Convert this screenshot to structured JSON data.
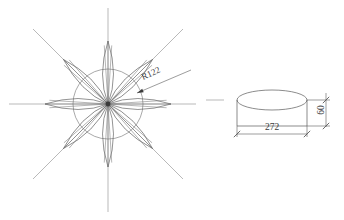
{
  "drawing": {
    "background_color": "#ffffff",
    "line_color": "#5a5a5a",
    "centerline_color": "#8a8a8a",
    "text_color": "#3a3a3a",
    "views": [
      {
        "name": "rosette-plan-view",
        "type": "plan",
        "center": {
          "x": 108,
          "y": 104
        },
        "petal_count": 8,
        "petal_length": 63,
        "petal_half_width": 11,
        "petal_angles_deg": [
          0,
          45,
          90,
          135,
          180,
          225,
          270,
          315
        ],
        "construction_circle_radius": 35,
        "centerlines": [
          {
            "name": "horizontal-centerline",
            "x1": 9,
            "y1": 104,
            "x2": 196,
            "y2": 104
          },
          {
            "name": "vertical-centerline",
            "x1": 108,
            "y1": 8,
            "x2": 108,
            "y2": 212
          },
          {
            "name": "diagonal-centerline-ne",
            "x1": 33,
            "y1": 29,
            "x2": 183,
            "y2": 179
          },
          {
            "name": "diagonal-centerline-nw",
            "x1": 183,
            "y1": 29,
            "x2": 33,
            "y2": 179
          }
        ],
        "radius_dimension": {
          "label": "R122",
          "leader_start": {
            "x": 191,
            "y": 70
          },
          "leader_end": {
            "x": 137,
            "y": 93
          },
          "text_x": 152,
          "text_y": 76,
          "text_rotation_deg": -24
        }
      },
      {
        "name": "cylinder-elevation-view",
        "type": "elevation",
        "ellipse_center": {
          "x": 272,
          "y": 100
        },
        "ellipse_rx": 35,
        "ellipse_ry": 10,
        "body_height": 26,
        "left_edge_x": 237,
        "right_edge_x": 307,
        "top_y": 100,
        "bottom_y": 126,
        "dimensions": [
          {
            "name": "width-dimension",
            "label": "272",
            "orientation": "horizontal",
            "x1": 237,
            "x2": 307,
            "y": 134,
            "text_x": 272,
            "text_y": 130,
            "text_rotation_deg": 0
          },
          {
            "name": "height-dimension",
            "label": "60",
            "orientation": "vertical",
            "x": 326,
            "y1": 97,
            "y2": 123,
            "text_x": 324,
            "text_y": 110,
            "text_rotation_deg": -90
          }
        ]
      }
    ]
  }
}
